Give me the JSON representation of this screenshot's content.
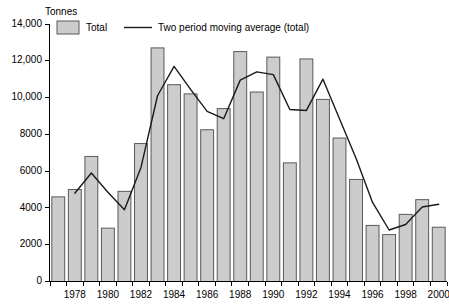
{
  "chart_data": {
    "type": "bar",
    "title": "",
    "xlabel": "",
    "ylabel": "Tonnes",
    "ylim": [
      0,
      14000
    ],
    "ytick_values": [
      0,
      2000,
      4000,
      6000,
      8000,
      10000,
      12000,
      14000
    ],
    "ytick_labels": [
      "0",
      "2000",
      "4000",
      "6000",
      "8000",
      "10,000",
      "12,000",
      "14,000"
    ],
    "grid": false,
    "legend_position": "top-left",
    "categories": [
      "1977",
      "1978",
      "1979",
      "1980",
      "1981",
      "1982",
      "1983",
      "1984",
      "1985",
      "1986",
      "1987",
      "1988",
      "1989",
      "1990",
      "1991",
      "1992",
      "1993",
      "1994",
      "1995",
      "1996",
      "1997",
      "1998",
      "1999",
      "2000"
    ],
    "xtick_labels": [
      "1978",
      "1980",
      "1982",
      "1984",
      "1986",
      "1988",
      "1990",
      "1992",
      "1994",
      "1996",
      "1998",
      "2000"
    ],
    "xtick_categories": [
      "1978",
      "1980",
      "1982",
      "1984",
      "1986",
      "1988",
      "1990",
      "1992",
      "1994",
      "1996",
      "1998",
      "2000"
    ],
    "series": [
      {
        "name": "Total",
        "kind": "bar",
        "color": "#cccccc",
        "values": [
          4600,
          5000,
          6800,
          2900,
          4900,
          7500,
          12700,
          10700,
          10200,
          8250,
          9400,
          12500,
          10300,
          12200,
          6450,
          12100,
          9900,
          7800,
          5550,
          3050,
          2550,
          3650,
          4450,
          2950
        ]
      },
      {
        "name": "Two period moving average (total)",
        "kind": "line",
        "color": "#1a1a1a",
        "values": [
          null,
          4800,
          5900,
          4850,
          3900,
          6200,
          10100,
          11700,
          10450,
          9250,
          8850,
          10950,
          11400,
          11250,
          9350,
          9300,
          11000,
          8850,
          6700,
          4300,
          2800,
          3100,
          4050,
          4200
        ]
      }
    ],
    "legend": [
      {
        "label": "Total",
        "marker": "swatch",
        "color": "#cccccc"
      },
      {
        "label": "Two period moving average (total)",
        "marker": "line",
        "color": "#1a1a1a"
      }
    ]
  }
}
